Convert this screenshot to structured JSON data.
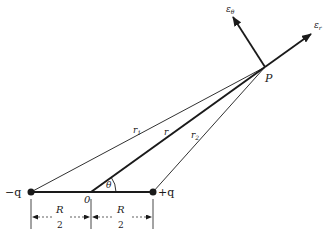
{
  "diagram": {
    "colors": {
      "ink": "#1a1a1a",
      "background": "#ffffff"
    },
    "points": {
      "neg_charge": {
        "label": "−q",
        "x": 31,
        "y": 192
      },
      "origin": {
        "label": "0",
        "x": 91,
        "y": 192
      },
      "pos_charge": {
        "label": "+q",
        "x": 153,
        "y": 192
      },
      "P": {
        "label": "P",
        "x": 265,
        "y": 67
      }
    },
    "lines": {
      "r1": {
        "label": "r",
        "sub": "1"
      },
      "r": {
        "label": "r"
      },
      "r2": {
        "label": "r",
        "sub": "2"
      }
    },
    "angle": {
      "label": "θ"
    },
    "vectors": {
      "e_theta": {
        "label": "ε",
        "sub": "θ"
      },
      "e_r": {
        "label": "ε",
        "sub": "r"
      }
    },
    "dimensions": [
      {
        "numerator": "R",
        "denominator": "2"
      },
      {
        "numerator": "R",
        "denominator": "2"
      }
    ]
  }
}
